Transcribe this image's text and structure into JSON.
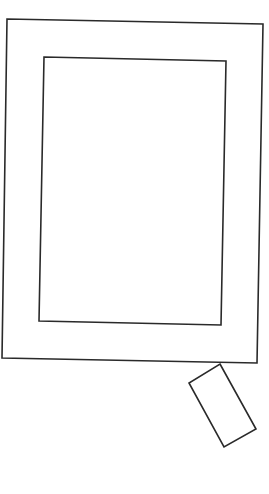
{
  "canvas": {
    "width": 269,
    "height": 494,
    "background": "#ffffff"
  },
  "stroke": {
    "color": "#2a2a2a",
    "width": 1.6
  },
  "shapes": {
    "outer_frame": {
      "points": "7,19 263,24 257,363 2,358"
    },
    "inner_frame": {
      "points": "44,57 226,61 221,325 39,321"
    },
    "small_rect": {
      "points": "220,364 256,429 224,447 189,383"
    }
  }
}
